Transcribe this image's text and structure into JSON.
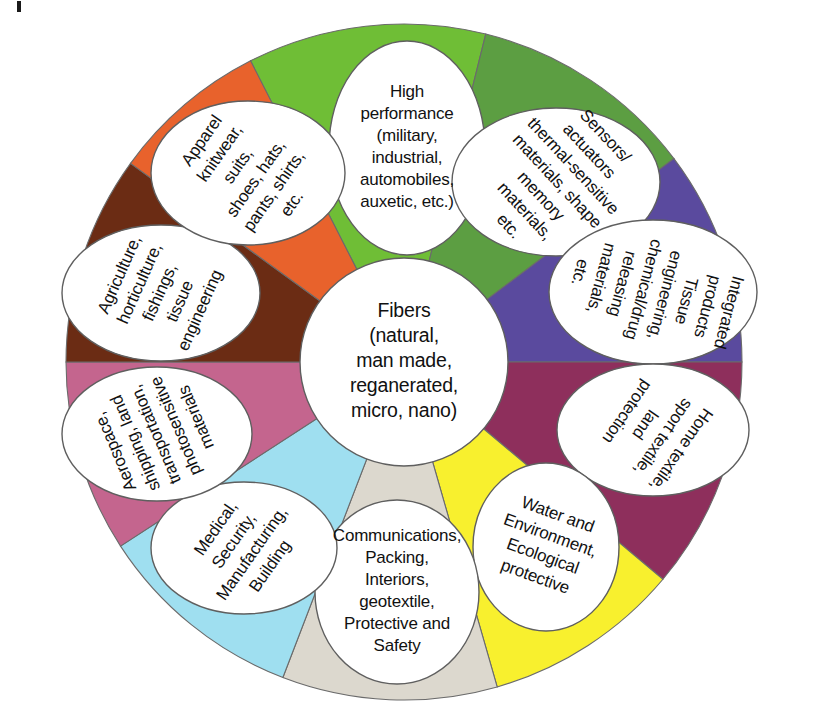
{
  "figure": {
    "type": "circular-wheel-diagram",
    "center": {
      "lines": [
        "Fibers",
        "(natural,",
        "man made,",
        "reganerated,",
        "micro, nano)"
      ]
    },
    "segments": [
      {
        "id": "high-performance",
        "color": "#6FBE36",
        "start_deg": -27,
        "end_deg": 14,
        "label_lines": [
          "High",
          "performance",
          "(military,",
          "industrial,",
          "automobiles,",
          "auxetic, etc.)"
        ],
        "rotation": 0,
        "ellipse": {
          "cx": 407,
          "cy": 148,
          "rx": 78,
          "ry": 107
        }
      },
      {
        "id": "sensors-actuators",
        "color": "#5C9E42",
        "start_deg": 14,
        "end_deg": 53,
        "label_lines": [
          "Sensors/",
          "actuators",
          "thermal-sensitive",
          "materials, shape",
          "memory",
          "materials,",
          "etc."
        ],
        "rotation": 47,
        "ellipse": {
          "cx": 556,
          "cy": 182,
          "rx": 104,
          "ry": 74
        }
      },
      {
        "id": "integrated-products",
        "color": "#5A4A9E",
        "start_deg": 53,
        "end_deg": 90,
        "label_lines": [
          "Integrated",
          "products",
          "Tissue",
          "engineering,",
          "chemical/drug",
          "releasing",
          "materials,",
          "etc."
        ],
        "rotation": 105,
        "ellipse": {
          "cx": 653,
          "cy": 292,
          "rx": 104,
          "ry": 72
        }
      },
      {
        "id": "home-textile",
        "color": "#8E2F5C",
        "start_deg": 90,
        "end_deg": 130,
        "label_lines": [
          "Home textile,",
          "sport textile,",
          "land",
          "protection"
        ],
        "rotation": 125,
        "ellipse": {
          "cx": 653,
          "cy": 430,
          "rx": 96,
          "ry": 66
        }
      },
      {
        "id": "water-environment",
        "color": "#F8F02E",
        "start_deg": 130,
        "end_deg": 164,
        "label_lines": [
          "Water and",
          "Environment,",
          "Ecological",
          "protective"
        ],
        "rotation": 20,
        "ellipse": {
          "cx": 546,
          "cy": 547,
          "rx": 73,
          "ry": 84
        }
      },
      {
        "id": "communications",
        "color": "#DCD8CE",
        "start_deg": 164,
        "end_deg": 201,
        "label_lines": [
          "Communications,",
          "Packing,",
          "Interiors,",
          "geotextile,",
          "Protective and",
          "Safety"
        ],
        "rotation": 0,
        "ellipse": {
          "cx": 397,
          "cy": 592,
          "rx": 82,
          "ry": 92
        }
      },
      {
        "id": "medical-security",
        "color": "#9FDFF0",
        "start_deg": 201,
        "end_deg": 237,
        "label_lines": [
          "Medical,",
          "Security,",
          "Manufacturing,",
          "Building"
        ],
        "rotation": -55,
        "ellipse": {
          "cx": 244,
          "cy": 548,
          "rx": 93,
          "ry": 66
        }
      },
      {
        "id": "aerospace",
        "color": "#C4658E",
        "start_deg": 237,
        "end_deg": 270,
        "label_lines": [
          "Aerospace,",
          "shipping, land",
          "transportation,",
          "photosensitive",
          "materials"
        ],
        "rotation": -113,
        "ellipse": {
          "cx": 157,
          "cy": 434,
          "rx": 95,
          "ry": 67
        }
      },
      {
        "id": "agriculture",
        "color": "#6B2C14",
        "start_deg": 270,
        "end_deg": 306,
        "label_lines": [
          "Agriculture,",
          "horticulture,",
          "fishings,",
          "tissue",
          "engineering"
        ],
        "rotation": -66,
        "ellipse": {
          "cx": 161,
          "cy": 293,
          "rx": 99,
          "ry": 68
        }
      },
      {
        "id": "apparel",
        "color": "#E8622C",
        "start_deg": 306,
        "end_deg": 333,
        "label_lines": [
          "Apparel",
          "knitwear,",
          "suits,",
          "shoes, hats,",
          "pants, shirts,",
          "etc."
        ],
        "rotation": -55,
        "ellipse": {
          "cx": 248,
          "cy": 173,
          "rx": 97,
          "ry": 72
        }
      }
    ],
    "geometry": {
      "cx": 404,
      "cy": 362,
      "outer_r": 338,
      "center_circle_r": 104,
      "ring_color": "#ffffff"
    },
    "corner_tick": "page-margin-tick"
  }
}
